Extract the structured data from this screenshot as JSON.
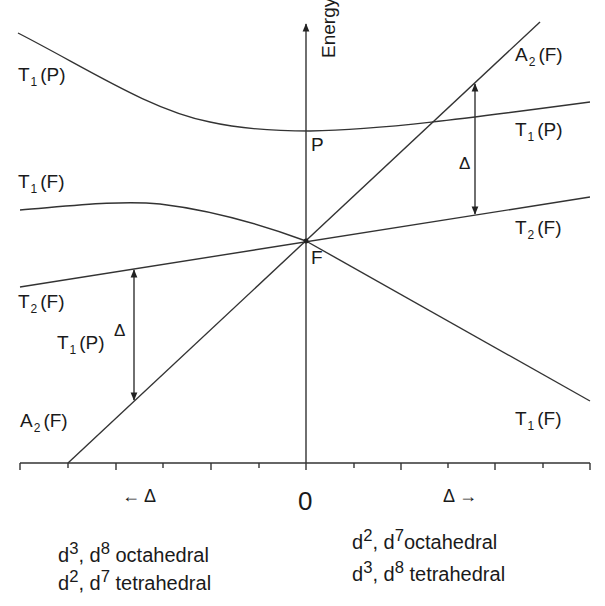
{
  "diagram": {
    "y_axis_label": "Energy",
    "x_axis_zero": "0",
    "x_left_label": "← Δ",
    "x_right_label": "Δ →",
    "free_ion_terms": {
      "upper": "P",
      "lower": "F"
    },
    "left_labels": [
      {
        "term": "T",
        "sub": "1",
        "paren": "(P)"
      },
      {
        "term": "T",
        "sub": "1",
        "paren": "(F)"
      },
      {
        "term": "T",
        "sub": "2",
        "paren": "(F)"
      },
      {
        "term": "T",
        "sub": "1",
        "paren": "(P)"
      },
      {
        "term": "A",
        "sub": "2",
        "paren": "(F)"
      }
    ],
    "right_labels": [
      {
        "term": "A",
        "sub": "2",
        "paren": "(F)"
      },
      {
        "term": "T",
        "sub": "1",
        "paren": "(P)"
      },
      {
        "term": "T",
        "sub": "2",
        "paren": "(F)"
      },
      {
        "term": "T",
        "sub": "1",
        "paren": "(F)"
      }
    ],
    "delta_symbol": "Δ",
    "left_caption": {
      "line1": {
        "a": "d",
        "a_sup": "3",
        "sep": ", d",
        "b_sup": "8",
        "rest": " octahedral"
      },
      "line2": {
        "a": "d",
        "a_sup": "2",
        "sep": ", d",
        "b_sup": "7",
        "rest": " tetrahedral"
      }
    },
    "right_caption": {
      "line1": {
        "a": "d",
        "a_sup": "2",
        "sep": ", d",
        "b_sup": "7",
        "rest": "octahedral"
      },
      "line2": {
        "a": "d",
        "a_sup": "3",
        "sep": ", d",
        "b_sup": "8",
        "rest": " tetrahedral"
      }
    },
    "line_color": "#333333"
  }
}
